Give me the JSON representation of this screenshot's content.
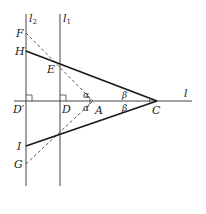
{
  "diagram": {
    "type": "geometry",
    "lines": {
      "l2": {
        "label": "l",
        "sub": "2"
      },
      "l1": {
        "label": "l",
        "sub": "1"
      },
      "l": {
        "label": "l"
      }
    },
    "points": {
      "F": "F",
      "H": "H",
      "E": "E",
      "D_prime": "D′",
      "D": "D",
      "A": "A",
      "C": "C",
      "I": "I",
      "G": "G"
    },
    "angles": {
      "alpha_top": "α",
      "alpha_bottom": "α",
      "beta_top": "β",
      "beta_bottom": "β"
    },
    "colors": {
      "stroke": "#1a1a1a",
      "thin": "#444444"
    }
  }
}
